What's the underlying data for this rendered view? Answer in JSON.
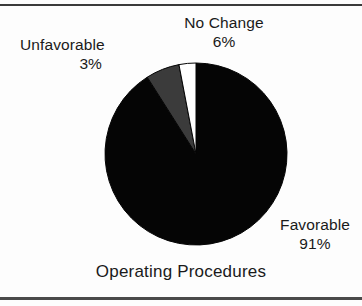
{
  "chart_data": {
    "type": "pie",
    "title": "Operating Procedures",
    "categories": [
      "Favorable",
      "No Change",
      "Unfavorable"
    ],
    "values": [
      91,
      6,
      3
    ],
    "value_labels": [
      "91%",
      "6%",
      "3%"
    ],
    "unit": "percent",
    "colors": [
      "#050505",
      "#3b3b3b",
      "#ffffff"
    ],
    "slice_outline_color": "#050505",
    "start_angle_deg": 0,
    "direction": "clockwise",
    "legend": "none",
    "labels_position": "outside-callout",
    "grid": false,
    "background": "#fdfdfd",
    "slices": [
      {
        "label": "Favorable",
        "value": 91,
        "value_label": "91%",
        "color": "#050505"
      },
      {
        "label": "No Change",
        "value": 6,
        "value_label": "6%",
        "color": "#3b3b3b"
      },
      {
        "label": "Unfavorable",
        "value": 3,
        "value_label": "3%",
        "color": "#ffffff"
      }
    ]
  },
  "figure": {
    "title": "Operating Procedures",
    "labels": {
      "unfavorable": {
        "name": "Unfavorable",
        "pct": "3%"
      },
      "nochange": {
        "name": "No Change",
        "pct": "6%"
      },
      "favorable": {
        "name": "Favorable",
        "pct": "91%"
      }
    }
  }
}
